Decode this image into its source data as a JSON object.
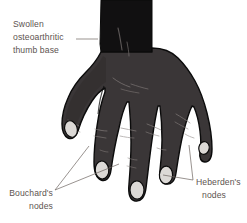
{
  "figure": {
    "background_color": "#ffffff"
  },
  "colors": {
    "forearm": "#111011",
    "hand_body": "#3a3637",
    "hand_body_shadow": "#2c2829",
    "outline": "#0b0b0b",
    "nail": "#dcd9d6",
    "nail_shade": "#c6c2bf",
    "crease": "#6f6a68",
    "label_text": "#5d5450",
    "leader_line": "#6d6460"
  },
  "annotations": [
    {
      "id": "thumb-base",
      "name": "swollen-thumb-base-label",
      "lines": [
        "Swollen",
        "osteoarthritic",
        "thumb base"
      ],
      "text": "Swollen osteoarthritic thumb base",
      "position": "top-left",
      "align": "left",
      "x": 13,
      "y": 27,
      "line_height": 13,
      "leaders": [
        {
          "d": "M 76 39 L 98 39"
        }
      ]
    },
    {
      "id": "bouchard",
      "name": "bouchards-nodes-label",
      "lines": [
        "Bouchard's",
        "nodes"
      ],
      "text": "Bouchard's nodes",
      "position": "bottom-left",
      "align": "right",
      "x": 53,
      "y": 196,
      "line_height": 13,
      "leaders": [
        {
          "d": "M 55 190 L 89 146"
        },
        {
          "d": "M 55 190 L 119 164"
        }
      ]
    },
    {
      "id": "heberden",
      "name": "heberdens-nodes-label",
      "lines": [
        "Heberden's",
        "nodes"
      ],
      "text": "Heberden's nodes",
      "position": "bottom-right",
      "align": "left",
      "x": 196,
      "y": 185,
      "line_height": 13,
      "leaders": [
        {
          "d": "M 193 180 L 163 175"
        },
        {
          "d": "M 193 180 L 189 145"
        }
      ]
    }
  ],
  "hand_parts": {
    "forearm": "wrist-forearm",
    "palm": "hand-dorsum",
    "thumb": "thumb",
    "index": "index-finger",
    "middle": "middle-finger",
    "ring": "ring-finger",
    "little": "little-finger",
    "nails": [
      "thumb-nail",
      "index-nail",
      "middle-nail",
      "ring-nail",
      "little-nail"
    ]
  }
}
